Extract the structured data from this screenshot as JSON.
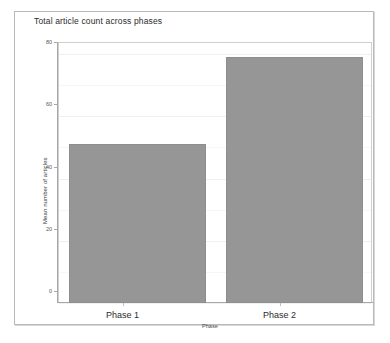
{
  "chart_data": {
    "type": "bar",
    "title": "Total article count across phases",
    "xlabel": "Phase",
    "ylabel": "Mean number of articles",
    "categories": [
      "Phase 1",
      "Phase 2"
    ],
    "values": [
      51,
      79
    ],
    "ylim": [
      0,
      80
    ],
    "yticks": [
      0,
      20,
      40,
      60,
      80
    ],
    "ytick_labels": [
      "0",
      "20",
      "40",
      "60",
      "80"
    ],
    "grid": true,
    "grid_axis": "y",
    "legend": "none",
    "bar_color": "#969696",
    "bar_edge_color": "#8e8e8e",
    "plot_background": "#ffffff",
    "gridline_color": "#f0f0f0",
    "axis_color": "#a8a8a8"
  },
  "figure": {
    "frame_border_color": "#b9b9b9",
    "page_background": "#ffffff",
    "bottom_caption": ""
  }
}
